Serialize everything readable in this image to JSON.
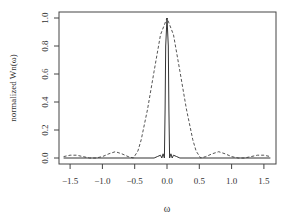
{
  "chart_data": {
    "type": "line",
    "title": "",
    "xlabel": "ω",
    "ylabel": "normalized Wn(ω)",
    "xlim": [
      -1.6,
      1.6
    ],
    "ylim": [
      0.0,
      1.0
    ],
    "x_ticks": [
      -1.5,
      -1.0,
      -0.5,
      0.0,
      0.5,
      1.0,
      1.5
    ],
    "x_tick_labels": [
      "−1.5",
      "−1.0",
      "−0.5",
      "0.0",
      "0.5",
      "1.0",
      "1.5"
    ],
    "y_ticks": [
      0.0,
      0.2,
      0.4,
      0.6,
      0.8,
      1.0
    ],
    "y_tick_labels": [
      "0.0",
      "0.2",
      "0.4",
      "0.6",
      "0.8",
      "1.0"
    ],
    "grid": false,
    "legend": null,
    "series": [
      {
        "name": "dashed (wide window)",
        "style": "dashed",
        "x": [
          -1.6,
          -1.5,
          -1.4,
          -1.3,
          -1.2,
          -1.1,
          -1.0,
          -0.9,
          -0.8,
          -0.7,
          -0.6,
          -0.52,
          -0.45,
          -0.4,
          -0.3,
          -0.2,
          -0.1,
          0.0,
          0.1,
          0.2,
          0.3,
          0.4,
          0.45,
          0.52,
          0.6,
          0.7,
          0.8,
          0.9,
          1.0,
          1.1,
          1.2,
          1.3,
          1.4,
          1.5,
          1.6
        ],
        "y": [
          0.01,
          0.02,
          0.02,
          0.01,
          0.0,
          0.0,
          0.01,
          0.03,
          0.045,
          0.03,
          0.01,
          0.0,
          0.05,
          0.13,
          0.35,
          0.62,
          0.88,
          1.0,
          0.88,
          0.62,
          0.35,
          0.13,
          0.05,
          0.0,
          0.01,
          0.03,
          0.045,
          0.03,
          0.01,
          0.0,
          0.0,
          0.01,
          0.02,
          0.02,
          0.01
        ]
      },
      {
        "name": "solid (narrow window)",
        "style": "solid",
        "x": [
          -1.6,
          -0.2,
          -0.15,
          -0.1,
          -0.08,
          -0.06,
          -0.04,
          -0.03,
          -0.02,
          0.0,
          0.02,
          0.03,
          0.04,
          0.06,
          0.08,
          0.1,
          0.15,
          0.2,
          1.6
        ],
        "y": [
          0.0,
          0.0,
          0.01,
          0.02,
          0.0,
          0.03,
          0.0,
          0.35,
          0.8,
          1.0,
          0.8,
          0.35,
          0.0,
          0.03,
          0.0,
          0.02,
          0.01,
          0.0,
          0.0
        ]
      }
    ]
  },
  "axes": {
    "xlabel": "ω",
    "ylabel": "normalized Wn(ω)"
  }
}
